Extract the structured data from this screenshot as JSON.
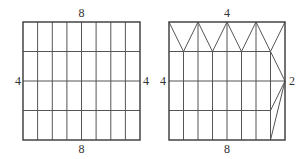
{
  "diagrams": [
    {
      "name": "left-square-grid",
      "labels": {
        "top": "8",
        "bottom": "8",
        "left": "4",
        "right": "4"
      },
      "columns": 8,
      "rows": 4
    },
    {
      "name": "right-folded-grid",
      "labels": {
        "top": "4",
        "bottom": "8",
        "left": "4",
        "right": "2"
      },
      "columns": 8,
      "rows": 4
    }
  ],
  "colors": {
    "line": "#555555",
    "border": "#444444",
    "text": "#333333",
    "background": "#ffffff"
  }
}
